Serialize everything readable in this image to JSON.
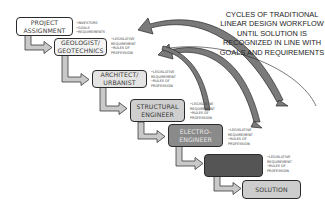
{
  "caption": "CYCLES OF TRADITIONAL LINEAR DESIGN WORKFLOW UNTIL SOLUTION IS RECOGNIZED IN LINE WITH GOALS AND REQUIREMENTS",
  "steps": [
    {
      "label_line1": "PROJECT",
      "label_line2": "ASSIGNMENT",
      "fill": "#ffffff",
      "text_color": "#3a3a3a",
      "notes": [
        "•INVESTORS",
        "•GOALS",
        "•REQUIREMENTS"
      ]
    },
    {
      "label_line1": "GEOLOGIST/",
      "label_line2": "GEOTECHNICS",
      "fill": "#f4f4f4",
      "text_color": "#3a3a3a",
      "notes": [
        "•LEGISLATIVE",
        " REQUIREMENT",
        "•RULES OF",
        " PROFESSION"
      ]
    },
    {
      "label_line1": "ARCHITECT/",
      "label_line2": "URBANIST",
      "fill": "#e4e4e4",
      "text_color": "#3a3a3a",
      "notes": [
        "•LEGISLATIVE",
        " REQUIREMENT",
        "•RULES OF",
        " PROFESSION"
      ]
    },
    {
      "label_line1": "STRUCTURAL",
      "label_line2": "ENGINEER",
      "fill": "#cfcfcf",
      "text_color": "#3a3a3a",
      "notes": [
        "•LEGISLATIVE",
        " REQUIREMENT",
        "•RULES OF",
        " PROFESSION"
      ]
    },
    {
      "label_line1": "ELECTRO-",
      "label_line2": "ENGINEER",
      "fill": "#8a8a8a",
      "text_color": "#e8e8e8",
      "notes": [
        "•LEGISLATIVE",
        " REQUIREMENT",
        "•RULES OF",
        " PROFESSION"
      ]
    },
    {
      "label_line1": "",
      "label_line2": "",
      "fill": "#555555",
      "text_color": "#e8e8e8",
      "notes": [
        "•LEGISLATIVE",
        " REQUIREMENT",
        "•RULES OF",
        " PROFESSION"
      ]
    },
    {
      "label_line1": "SOLUTION",
      "label_line2": "",
      "fill": "#cdcdcd",
      "text_color": "#3a3a3a",
      "notes": []
    }
  ],
  "colors": {
    "arrow_fill": "#c9c9c9",
    "arrow_stroke": "#3a3a3a",
    "curve_fill": "#7a7a7a",
    "curve_stroke": "#2a2a2a"
  }
}
